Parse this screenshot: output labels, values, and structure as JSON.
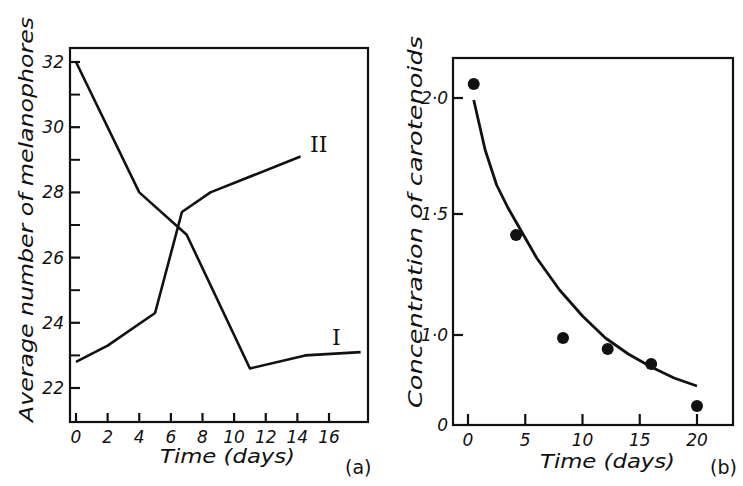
{
  "panel_a": {
    "ylabel": "Average number of melanophores",
    "xlabel": "Time (days)",
    "panel_label": "(a)",
    "y_ticks": [
      "32",
      "30",
      "28",
      "26",
      "24",
      "22"
    ],
    "x_ticks": [
      "0",
      "2",
      "4",
      "6",
      "8",
      "10",
      "12",
      "14",
      "16"
    ],
    "curve_labels": [
      "I",
      "II"
    ]
  },
  "panel_b": {
    "ylabel": "Concentration of carotenoids",
    "xlabel": "Time (days)",
    "panel_label": "(b)",
    "y_ticks": [
      "2·0",
      "1·5",
      "1·0",
      "0"
    ],
    "x_ticks": [
      "0",
      "5",
      "10",
      "15",
      "20"
    ]
  },
  "chart_data": [
    {
      "type": "line",
      "title": "",
      "panel": "(a)",
      "xlabel": "Time (days)",
      "ylabel": "Average number of melanophores",
      "xlim": [
        0,
        18
      ],
      "ylim": [
        21,
        32.8
      ],
      "x_ticks": [
        0,
        2,
        4,
        6,
        8,
        10,
        12,
        14,
        16
      ],
      "y_ticks": [
        22,
        24,
        26,
        28,
        30,
        32
      ],
      "grid": false,
      "series": [
        {
          "name": "I",
          "x": [
            0,
            4,
            7,
            11,
            14.5,
            18
          ],
          "y": [
            32,
            28,
            26.7,
            22.6,
            23.0,
            23.1
          ]
        },
        {
          "name": "II",
          "x": [
            0,
            2,
            5,
            6.7,
            8.5,
            14.2
          ],
          "y": [
            22.8,
            23.3,
            24.3,
            27.4,
            28.0,
            29.1
          ]
        }
      ],
      "annotations": [
        "I",
        "II"
      ]
    },
    {
      "type": "scatter",
      "title": "",
      "panel": "(b)",
      "xlabel": "Time (days)",
      "ylabel": "Concentration of carotenoids",
      "xlim": [
        -1.5,
        23
      ],
      "ylim": [
        0,
        2.2
      ],
      "x_ticks": [
        0,
        5,
        10,
        15,
        20
      ],
      "y_ticks": [
        0,
        1.0,
        1.5,
        2.0
      ],
      "grid": false,
      "series": [
        {
          "name": "measured",
          "x": [
            0.5,
            4.2,
            8.3,
            12.2,
            16.0,
            20.0
          ],
          "y": [
            2.06,
            1.41,
            0.98,
            0.92,
            0.85,
            0.68
          ]
        },
        {
          "name": "fitted curve",
          "type": "line",
          "x": [
            0.5,
            2,
            4.2,
            6,
            8,
            10,
            12,
            14,
            16,
            18,
            20
          ],
          "y": [
            2.02,
            1.72,
            1.4,
            1.23,
            1.09,
            0.99,
            0.92,
            0.87,
            0.83,
            0.8,
            0.78
          ]
        }
      ]
    }
  ]
}
